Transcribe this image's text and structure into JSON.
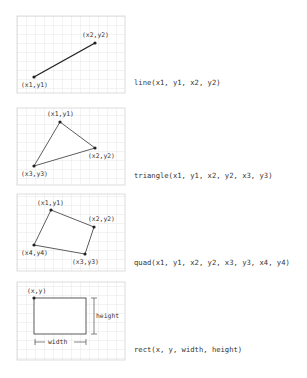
{
  "colors": {
    "grid": "#d9d9d9",
    "border": "#cfcfcf",
    "shape": "#333333",
    "text": "#333333"
  },
  "panels": [
    {
      "id": "line",
      "signature": "line(x1, y1, x2, y2)",
      "labels": {
        "p1": "(x1,y1)",
        "p2": "(x2,y2)"
      }
    },
    {
      "id": "triangle",
      "signature": "triangle(x1, y1, x2, y2, x3, y3)",
      "labels": {
        "p1": "(x1,y1)",
        "p2": "(x2,y2)",
        "p3": "(x3,y3)"
      }
    },
    {
      "id": "quad",
      "signature": "quad(x1, y1, x2, y2, x3, y3, x4, y4)",
      "labels": {
        "p1": "(x1,y1)",
        "p2": "(x2,y2)",
        "p3": "(x3,y3)",
        "p4": "(x4,y4)"
      }
    },
    {
      "id": "rect",
      "signature": "rect(x, y, width, height)",
      "labels": {
        "origin": "(x,y)",
        "width": "width",
        "height": "height"
      }
    }
  ]
}
